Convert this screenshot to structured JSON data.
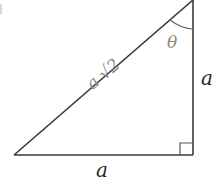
{
  "figure": {
    "type": "right-triangle",
    "vertices": {
      "bottom_left": [
        14,
        155
      ],
      "bottom_right": [
        193,
        155
      ],
      "top_right": [
        193,
        0
      ]
    },
    "labels": {
      "hypotenuse": "a √2",
      "vertical_leg": "a",
      "horizontal_leg": "a",
      "angle": "θ"
    },
    "colors": {
      "stroke": "#333333",
      "label_main": "#2a2a2a",
      "label_handwritten": "#8a8a8a"
    }
  }
}
